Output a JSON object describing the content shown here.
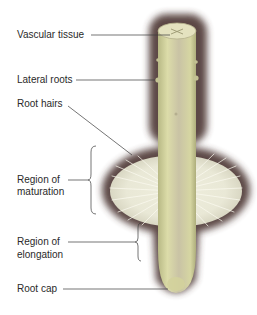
{
  "diagram": {
    "labels": {
      "vascular_tissue": "Vascular tissue",
      "lateral_roots": "Lateral roots",
      "root_hairs": "Root hairs",
      "maturation_line1": "Region of",
      "maturation_line2": "maturation",
      "elongation_line1": "Region of",
      "elongation_line2": "elongation",
      "root_cap": "Root cap"
    },
    "colors": {
      "root_body": "#d8d9a6",
      "root_shade": "#b9b98a",
      "halo": "#4a3530",
      "root_hairs": "#f1efe4",
      "leader_line": "#3a3a3a",
      "text": "#2a2a2a"
    }
  }
}
